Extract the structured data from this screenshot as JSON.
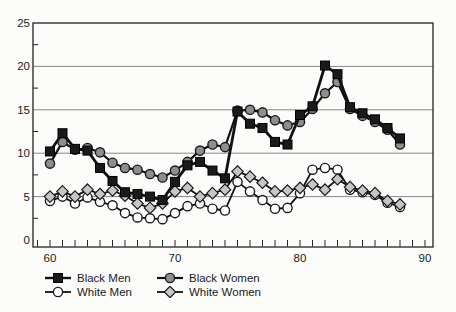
{
  "figure": {
    "background": "#fcfcfb",
    "frame_color": "#222222",
    "grid_color": "#7a7a7a",
    "text_color": "#1a1a1a"
  },
  "chart_data": {
    "type": "line",
    "title": "",
    "xlabel": "",
    "ylabel": "",
    "x": [
      60,
      61,
      62,
      63,
      64,
      65,
      66,
      67,
      68,
      69,
      70,
      71,
      72,
      73,
      74,
      75,
      76,
      77,
      78,
      79,
      80,
      81,
      82,
      83,
      84,
      85,
      86,
      87,
      88
    ],
    "x_tick_labels": [
      "60",
      "70",
      "80",
      "90"
    ],
    "x_tick_values": [
      60,
      70,
      80,
      90
    ],
    "x_minor_tick_step": 1,
    "x_minor_tick_start": 59,
    "x_minor_tick_end": 90,
    "x_range": [
      58.6,
      90.6
    ],
    "y_tick_labels": [
      "0",
      "5",
      "10",
      "15",
      "20",
      "25"
    ],
    "y_tick_values": [
      0,
      5,
      10,
      15,
      20,
      25
    ],
    "y_minor_tick_values": [
      2.5,
      7.5,
      12.5,
      17.5,
      22.5
    ],
    "ylim": [
      0,
      25
    ],
    "grid": "horizontal-major",
    "legend_position": "below-two-columns",
    "series": [
      {
        "name": "Black Men",
        "marker": "square",
        "marker_fill": "#1a1a1a",
        "marker_stroke": "#000000",
        "line_color": "#111111",
        "line_width": 2.8,
        "values": [
          10.2,
          12.3,
          10.5,
          10.3,
          8.3,
          6.8,
          5.5,
          5.3,
          5.0,
          4.6,
          6.7,
          8.6,
          9.0,
          8.0,
          7.1,
          14.8,
          13.4,
          12.9,
          11.3,
          11.0,
          14.4,
          15.4,
          20.1,
          19.1,
          15.3,
          14.6,
          13.9,
          12.9,
          11.7
        ]
      },
      {
        "name": "Black Women",
        "marker": "circle",
        "marker_fill": "#8e8e8e",
        "marker_stroke": "#1a1a1a",
        "line_color": "#111111",
        "line_width": 2.2,
        "values": [
          8.8,
          11.3,
          10.4,
          10.6,
          10.1,
          8.9,
          8.3,
          8.1,
          7.6,
          7.2,
          8.0,
          9.0,
          10.3,
          11.0,
          10.7,
          14.9,
          15.0,
          14.7,
          13.8,
          13.2,
          13.6,
          15.1,
          16.9,
          18.2,
          15.1,
          14.3,
          13.6,
          12.7,
          11.0
        ]
      },
      {
        "name": "White Men",
        "marker": "circle",
        "marker_fill": "#ffffff",
        "marker_stroke": "#1a1a1a",
        "line_color": "#111111",
        "line_width": 1.8,
        "values": [
          4.5,
          5.0,
          4.2,
          4.9,
          4.4,
          4.0,
          3.1,
          2.6,
          2.5,
          2.4,
          3.1,
          3.9,
          4.2,
          3.6,
          3.4,
          6.7,
          5.6,
          4.6,
          3.6,
          3.7,
          5.4,
          8.1,
          8.3,
          8.1,
          5.8,
          5.5,
          5.2,
          4.3,
          3.8
        ]
      },
      {
        "name": "White Women",
        "marker": "diamond",
        "marker_fill": "#c6c6c6",
        "marker_stroke": "#1a1a1a",
        "line_color": "#111111",
        "line_width": 1.8,
        "values": [
          5.0,
          5.6,
          5.0,
          5.8,
          5.3,
          5.7,
          5.1,
          4.2,
          3.7,
          4.2,
          5.6,
          6.0,
          5.0,
          5.4,
          5.8,
          7.9,
          7.3,
          6.6,
          5.6,
          5.7,
          6.0,
          6.4,
          5.8,
          7.0,
          6.1,
          5.7,
          5.4,
          4.5,
          4.1
        ]
      }
    ]
  }
}
